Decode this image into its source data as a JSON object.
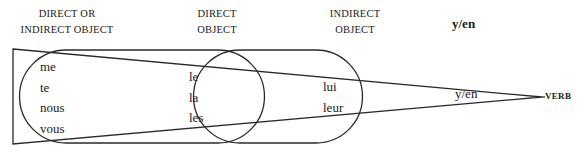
{
  "headers": {
    "direct_or_indirect": [
      "DIRECT OR",
      "INDIRECT OBJECT"
    ],
    "direct": [
      "DIRECT",
      "OBJECT"
    ],
    "indirect": [
      "INDIRECT",
      "OBJECT"
    ],
    "yen": "y/en"
  },
  "groups": {
    "direct_or_indirect": [
      "me",
      "te",
      "nous",
      "vous"
    ],
    "direct": [
      "le",
      "la",
      "les"
    ],
    "indirect": [
      "lui",
      "leur"
    ]
  },
  "yen_label": "y/en",
  "verb_label": "VERB",
  "colors": {
    "line": "#2a2a2a",
    "text": "#1a1a1a"
  }
}
